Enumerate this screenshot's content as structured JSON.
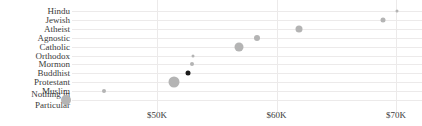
{
  "chart_data": {
    "type": "scatter",
    "title": "",
    "subtitle": "",
    "xlabel": "",
    "ylabel": "",
    "orientation": "horizontal-dot-plot",
    "grid": "both-faint",
    "legend": "none",
    "xlim": [
      40000,
      72000
    ],
    "xticks": [
      50000,
      60000,
      70000
    ],
    "xticklabels": [
      "$50K",
      "$60K",
      "$70K"
    ],
    "categories": [
      "Hindu",
      "Jewish",
      "Atheist",
      "Agnostic",
      "Catholic",
      "Orthodox",
      "Mormon",
      "Buddhist",
      "Protestant",
      "Muslim",
      "Nothing in Particular"
    ],
    "values": [
      70100,
      68900,
      61900,
      58400,
      56900,
      53000,
      52900,
      52600,
      51400,
      45600,
      42400
    ],
    "value_labels": [
      "$70.1K",
      "$68.9K",
      "$61.9K",
      "$58.4K",
      "$56.9K",
      "$53.0K",
      "$52.9K",
      "$52.6K",
      "$51.4K",
      "$45.6K",
      "$42.4K"
    ],
    "marker_sizes": [
      3,
      5,
      7,
      6,
      9,
      3,
      4,
      5,
      11,
      4,
      10
    ],
    "highlighted": [
      "Buddhist"
    ],
    "colors": {
      "marker": "#b4b4b4",
      "marker_highlight": "#1b1b1b",
      "grid": "#eceaea",
      "background": "#ffffff",
      "text": "#3a3a3a"
    },
    "points": [
      {
        "category": "Hindu",
        "label_line1": "Hindu",
        "label_line2": "",
        "value": 70100,
        "size": 3,
        "highlight": false
      },
      {
        "category": "Jewish",
        "label_line1": "Jewish",
        "label_line2": "",
        "value": 68900,
        "size": 5,
        "highlight": false
      },
      {
        "category": "Atheist",
        "label_line1": "Atheist",
        "label_line2": "",
        "value": 61900,
        "size": 7,
        "highlight": false
      },
      {
        "category": "Agnostic",
        "label_line1": "Agnostic",
        "label_line2": "",
        "value": 58400,
        "size": 6,
        "highlight": false
      },
      {
        "category": "Catholic",
        "label_line1": "Catholic",
        "label_line2": "",
        "value": 56900,
        "size": 9,
        "highlight": false
      },
      {
        "category": "Orthodox",
        "label_line1": "Orthodox",
        "label_line2": "",
        "value": 53000,
        "size": 3,
        "highlight": false
      },
      {
        "category": "Mormon",
        "label_line1": "Mormon",
        "label_line2": "",
        "value": 52900,
        "size": 4,
        "highlight": false
      },
      {
        "category": "Buddhist",
        "label_line1": "Buddhist",
        "label_line2": "",
        "value": 52600,
        "size": 5,
        "highlight": true
      },
      {
        "category": "Protestant",
        "label_line1": "Protestant",
        "label_line2": "",
        "value": 51400,
        "size": 11,
        "highlight": false
      },
      {
        "category": "Muslim",
        "label_line1": "Muslim",
        "label_line2": "",
        "value": 45600,
        "size": 4,
        "highlight": false
      },
      {
        "category": "Nothing in Particular",
        "label_line1": "Nothing in",
        "label_line2": "Particular",
        "value": 42400,
        "size": 10,
        "highlight": false
      }
    ]
  }
}
